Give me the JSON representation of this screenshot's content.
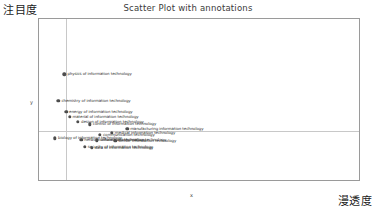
{
  "chart_data": {
    "type": "scatter",
    "title": "Scatter Plot with annotations",
    "xlabel": "x",
    "ylabel": "y",
    "axis_name_y_cjk": "注目度",
    "axis_name_x_cjk": "漫透度",
    "xlim": [
      0.0,
      0.019
    ],
    "ylim": [
      0.25,
      2.6
    ],
    "grid": false,
    "legend": null,
    "xticks": [
      "0.00%",
      "0.25%",
      "0.50%",
      "0.75%",
      "1.00%",
      "1.25%",
      "1.50%",
      "1.75%"
    ],
    "xtick_values": [
      0.0,
      0.0025,
      0.005,
      0.0075,
      0.01,
      0.0125,
      0.015,
      0.0175
    ],
    "yticks": [
      "2.5",
      "2.0",
      "1.5",
      "1.0",
      "0.5"
    ],
    "ytick_values": [
      2.5,
      2.0,
      1.5,
      1.0,
      0.5
    ],
    "reference_lines": {
      "vertical_x": 0.0016,
      "horizontal_y": 0.98
    },
    "point_color": "#4d4d4d",
    "points": [
      {
        "x": 0.0015,
        "y": 1.8,
        "label": "physics of information technology"
      },
      {
        "x": 0.00115,
        "y": 1.42,
        "label": "chemistry of information technology"
      },
      {
        "x": 0.0016,
        "y": 1.26,
        "label": "energy of information technology"
      },
      {
        "x": 0.0018,
        "y": 1.19,
        "label": "material of information technology"
      },
      {
        "x": 0.0023,
        "y": 1.12,
        "label": "design of information technology"
      },
      {
        "x": 0.003,
        "y": 1.08,
        "label": "control of information technology"
      },
      {
        "x": 0.0052,
        "y": 1.02,
        "label": "manufacturing information technology"
      },
      {
        "x": 0.0043,
        "y": 0.96,
        "label": "medical information technology"
      },
      {
        "x": 0.0036,
        "y": 0.93,
        "label": "communication technology"
      },
      {
        "x": 0.00095,
        "y": 0.88,
        "label": "biology of information technology"
      },
      {
        "x": 0.0025,
        "y": 0.86,
        "label": "network information technology"
      },
      {
        "x": 0.0034,
        "y": 0.85,
        "label": "software of information technology"
      },
      {
        "x": 0.0045,
        "y": 0.84,
        "label": "sensor information technology"
      },
      {
        "x": 0.0027,
        "y": 0.76,
        "label": "security of information technology"
      },
      {
        "x": 0.0031,
        "y": 0.74,
        "label": "data of information technology"
      }
    ]
  }
}
